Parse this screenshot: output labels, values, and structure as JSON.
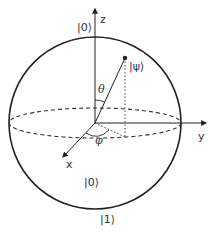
{
  "diagram": {
    "colors": {
      "stroke": "#222222",
      "text": "#333333",
      "background": "#ffffff"
    },
    "axes": {
      "z_label": "z",
      "y_label": "y",
      "x_label": "x"
    },
    "states": {
      "top_label": "|0⟩",
      "state_label": "|ψ⟩",
      "inner_label": "|0⟩",
      "bottom_label": "|1⟩"
    },
    "angles": {
      "polar": "θ",
      "azimuthal": "φ"
    }
  }
}
